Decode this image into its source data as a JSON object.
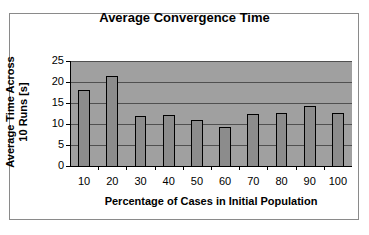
{
  "chart_data": {
    "type": "bar",
    "title": "Average Convergence Time",
    "xlabel": "Percentage of Cases in Initial Population",
    "ylabel": "Average Time Across 10 Runs [s]",
    "categories": [
      "10",
      "20",
      "30",
      "40",
      "50",
      "60",
      "70",
      "80",
      "90",
      "100"
    ],
    "values": [
      18,
      21.5,
      12,
      12.2,
      11,
      9.3,
      12.4,
      12.6,
      14.3,
      12.7
    ],
    "ylim": [
      0,
      25
    ],
    "yticks": [
      "0",
      "5",
      "10",
      "15",
      "20",
      "25"
    ],
    "grid": true,
    "legend": null,
    "colors": {
      "plot_background": "#a0a0a0",
      "bar_fill": "#8c8c8c",
      "bar_border": "#000000",
      "gridline": "#505050"
    }
  }
}
